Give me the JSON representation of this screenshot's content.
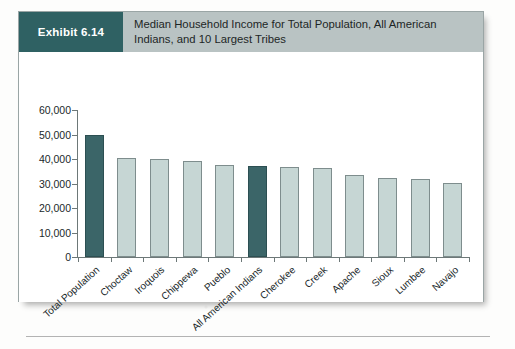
{
  "exhibit": {
    "badge_label": "Exhibit 6.14",
    "title": "Median Household Income for Total Population, All American Indians, and 10 Largest Tribes",
    "badge_color": "#2f6163",
    "header_band_color": "#b9c3c3"
  },
  "chart_data": {
    "type": "bar",
    "title": "Median Household Income for Total Population, All American Indians, and 10 Largest Tribes",
    "xlabel": "",
    "ylabel": "",
    "ylim": [
      0,
      60000
    ],
    "yticks": [
      "0",
      "10,000",
      "20,000",
      "30,000",
      "40,000",
      "50,000",
      "60,000"
    ],
    "ytick_values": [
      0,
      10000,
      20000,
      30000,
      40000,
      50000,
      60000
    ],
    "grid": false,
    "legend": "none",
    "categories": [
      "Total Population",
      "Choctaw",
      "Iroquois",
      "Chippewa",
      "Pueblo",
      "All American Indians",
      "Cherokee",
      "Creek",
      "Apache",
      "Sioux",
      "Lumbee",
      "Navajo"
    ],
    "values": [
      49800,
      40500,
      40200,
      39300,
      37700,
      37000,
      36800,
      36200,
      33400,
      32200,
      31900,
      30200
    ],
    "bar_styles": [
      "dark",
      "light",
      "light",
      "light",
      "light",
      "dark",
      "light",
      "light",
      "light",
      "light",
      "light",
      "light"
    ],
    "colors": {
      "dark_bar": "#3b6568",
      "light_bar": "#c6d6d4",
      "bar_outline": "#7e8d8d",
      "axis": "#6d7878"
    }
  }
}
